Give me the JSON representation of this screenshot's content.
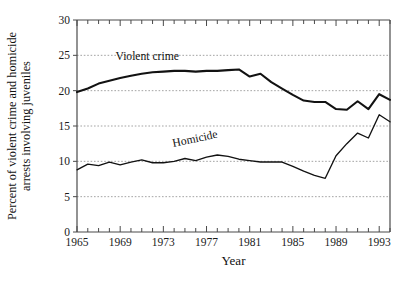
{
  "chart_data": {
    "type": "line",
    "title": "",
    "xlabel": "Year",
    "ylabel_line1": "Percent of violent crime and homicide",
    "ylabel_line2": "arrests involving juveniles",
    "xlim": [
      1965,
      1994
    ],
    "ylim": [
      0,
      30
    ],
    "yticks": [
      0,
      5,
      10,
      15,
      20,
      25,
      30
    ],
    "ytick_labels": [
      "0",
      "5",
      "10",
      "15",
      "20",
      "25",
      "30"
    ],
    "xticks": [
      1965,
      1966,
      1967,
      1968,
      1969,
      1970,
      1971,
      1972,
      1973,
      1974,
      1975,
      1976,
      1977,
      1978,
      1979,
      1980,
      1981,
      1982,
      1983,
      1984,
      1985,
      1986,
      1987,
      1988,
      1989,
      1990,
      1991,
      1992,
      1993,
      1994
    ],
    "xtick_labels_shown": [
      "1965",
      "1969",
      "1973",
      "1977",
      "1981",
      "1985",
      "1989",
      "1993"
    ],
    "xtick_label_years": [
      1965,
      1969,
      1973,
      1977,
      1981,
      1985,
      1989,
      1993
    ],
    "grid": "horizontal-dashed",
    "legend_position": "inline-annotations",
    "x": [
      1965,
      1966,
      1967,
      1968,
      1969,
      1970,
      1971,
      1972,
      1973,
      1974,
      1975,
      1976,
      1977,
      1978,
      1979,
      1980,
      1981,
      1982,
      1983,
      1984,
      1985,
      1986,
      1987,
      1988,
      1989,
      1990,
      1991,
      1992,
      1993,
      1994
    ],
    "series": [
      {
        "name": "Violent crime",
        "label_text": "Violent crime",
        "color": "#121212",
        "values": [
          19.8,
          20.3,
          21.0,
          21.4,
          21.8,
          22.1,
          22.4,
          22.6,
          22.7,
          22.8,
          22.8,
          22.7,
          22.8,
          22.8,
          22.9,
          23.0,
          22.0,
          22.4,
          21.2,
          20.3,
          19.4,
          18.6,
          18.4,
          18.4,
          17.4,
          17.3,
          17.3,
          16.3,
          15.5,
          15.5
        ]
      },
      {
        "name": "Homicide",
        "label_text": "Homicide",
        "color": "#121212",
        "values": [
          8.8,
          9.6,
          9.4,
          9.9,
          9.5,
          9.9,
          10.2,
          9.8,
          9.8,
          10.0,
          10.4,
          10.1,
          10.6,
          10.9,
          10.7,
          10.3,
          10.1,
          9.9,
          9.9,
          9.9,
          9.3,
          8.6,
          8.0,
          7.6,
          7.6,
          8.2,
          8.6,
          8.6,
          9.0,
          9.7
        ]
      }
    ],
    "series_violent_tail": {
      "years": [
        1989,
        1990,
        1991,
        1992,
        1993,
        1994
      ],
      "values": [
        17.4,
        17.3,
        18.5,
        17.4,
        19.5,
        18.7
      ]
    },
    "series_homicide_tail": {
      "years": [
        1989,
        1990,
        1991,
        1992,
        1993,
        1994
      ],
      "values": [
        10.8,
        12.5,
        14.0,
        13.3,
        16.6,
        15.6
      ]
    },
    "annotations": [
      {
        "text": "Violent crime",
        "x_year": 1971.5,
        "y_value": 24.4,
        "rotation": 0
      },
      {
        "text": "Homicide",
        "x_year": 1976.0,
        "y_value": 12.7,
        "rotation": -12
      }
    ]
  }
}
